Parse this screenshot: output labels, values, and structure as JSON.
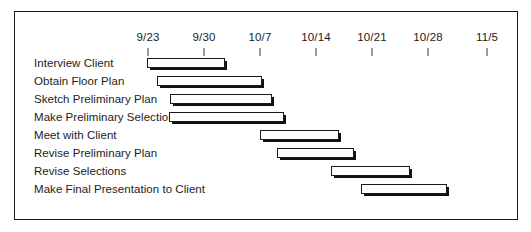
{
  "chart_data": {
    "type": "bar",
    "chart_kind": "gantt",
    "title": "",
    "xlabel": "",
    "ylabel": "",
    "grid": false,
    "legend": null,
    "axis": {
      "tick_labels": [
        "9/23",
        "9/30",
        "10/7",
        "10/14",
        "10/21",
        "10/28",
        "11/5"
      ],
      "tick_x_px": [
        147,
        203,
        259,
        315,
        371,
        427,
        486
      ],
      "pixels_per_day": 8,
      "range_start_label": "9/23",
      "range_end_label": "11/5"
    },
    "categories": [
      "Interview Client",
      "Obtain Floor Plan",
      "Sketch Preliminary Plan",
      "Make Preliminary Selections",
      "Meet with Client",
      "Revise Preliminary Plan",
      "Revise Selections",
      "Make Final Presentation to Client"
    ],
    "bars": [
      {
        "label": "Interview Client",
        "start_px": 146,
        "end_px": 224,
        "start_date": "9/23",
        "end_date": "10/2",
        "duration_days": 10,
        "row_y_px": 62
      },
      {
        "label": "Obtain Floor Plan",
        "start_px": 156,
        "end_px": 261,
        "start_date": "9/24",
        "end_date": "10/7",
        "duration_days": 13,
        "row_y_px": 80
      },
      {
        "label": "Sketch Preliminary Plan",
        "start_px": 169,
        "end_px": 271,
        "start_date": "9/26",
        "end_date": "10/8",
        "duration_days": 13,
        "row_y_px": 98
      },
      {
        "label": "Make Preliminary Selections",
        "start_px": 168,
        "end_px": 283,
        "start_date": "9/26",
        "end_date": "10/10",
        "duration_days": 14,
        "row_y_px": 116
      },
      {
        "label": "Meet with Client",
        "start_px": 259,
        "end_px": 338,
        "start_date": "10/7",
        "end_date": "10/17",
        "duration_days": 10,
        "row_y_px": 134
      },
      {
        "label": "Revise Preliminary Plan",
        "start_px": 276,
        "end_px": 353,
        "start_date": "10/9",
        "end_date": "10/19",
        "duration_days": 10,
        "row_y_px": 152
      },
      {
        "label": "Revise Selections",
        "start_px": 330,
        "end_px": 409,
        "start_date": "10/16",
        "end_date": "10/26",
        "duration_days": 10,
        "row_y_px": 170
      },
      {
        "label": "Make Final Presentation to Client",
        "start_px": 360,
        "end_px": 446,
        "start_date": "10/20",
        "end_date": "10/31",
        "duration_days": 11,
        "row_y_px": 188
      }
    ],
    "colors": {
      "bar_fill": "#fdfdfd",
      "bar_outline": "#1a1a1a",
      "bar_shadow": "#111111",
      "text": "#1c1c1c",
      "frame": "#1a1a1a",
      "background": "#ffffff"
    }
  }
}
